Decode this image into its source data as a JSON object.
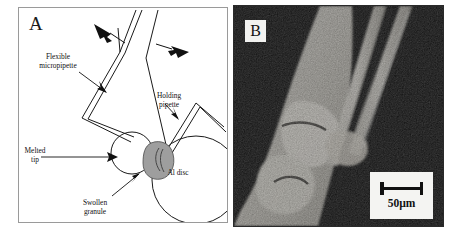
{
  "figure": {
    "panels": [
      {
        "letter": "A",
        "type": "line-diagram",
        "caption_labels": [
          {
            "name": "flexible-micropipette",
            "text": "Flexible\nmicropipette"
          },
          {
            "name": "holding-pipette",
            "text": "Holding\npipette"
          },
          {
            "name": "melted-tip",
            "text": "Melted\ntip"
          },
          {
            "name": "swollen-granule",
            "text": "Swollen\ngranule"
          },
          {
            "name": "al-disc",
            "text": "Al disc"
          }
        ]
      },
      {
        "letter": "B",
        "type": "micrograph",
        "scalebar": {
          "label": "50µm",
          "value": 50,
          "unit": "µm"
        }
      }
    ]
  },
  "colors": {
    "panel_a_background": "#ffffff",
    "panel_a_border": "#9a9a9a",
    "line_stroke": "#1a1a1a",
    "granule_fill": "#9e9e9e",
    "panel_b_background": "#0a0a0a",
    "panel_b_tissue": "#e8e6e0",
    "scalebar_box": "#f4f4f2",
    "text": "#111111"
  }
}
